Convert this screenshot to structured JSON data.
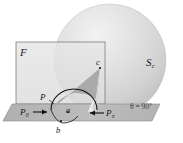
{
  "figure": {
    "type": "geometric-diagram",
    "labels": {
      "plane_F": "F",
      "sphere_S": "S",
      "sphere_S_sub": "c",
      "apex_c": "c",
      "point_P": "P",
      "point_a": "a",
      "point_b": "b",
      "P_zero": "P",
      "P_zero_sub": "0",
      "P_pi": "P",
      "P_pi_sub": "π",
      "theta_text": "θ = 90°",
      "theta_symbol": "θ",
      "theta_value": "= 90°"
    },
    "colors": {
      "sphere_fill": "#d9d9d9",
      "sphere_highlight": "#ececec",
      "plane_fill": "#e3e3e3",
      "ground_fill": "#b4b4b4",
      "cone_dark": "#a8a8a8",
      "cone_light": "#e8e8e8",
      "stroke": "#1a1a1a",
      "background": "#ffffff"
    },
    "geometry": {
      "sphere_center_x": 110,
      "sphere_center_y": 60,
      "sphere_radius": 56,
      "plane_rect": [
        16,
        42,
        89,
        62
      ],
      "ground_strip_y": 104,
      "apex_point": [
        100,
        68
      ],
      "arc_left": [
        51,
        110
      ],
      "arc_right": [
        97,
        110
      ]
    }
  }
}
